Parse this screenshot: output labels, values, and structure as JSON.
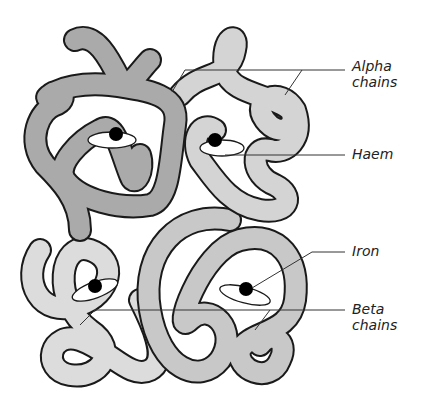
{
  "labels": {
    "alpha": "Alpha\nchains",
    "alpha_line1": "Alpha",
    "alpha_line2": "chains",
    "haem": "Haem",
    "iron": "Iron",
    "beta_line1": "Beta",
    "beta_line2": "chains"
  },
  "colors": {
    "alpha_dark": "#a8a8a8",
    "alpha_light": "#cfcfcf",
    "beta_light": "#dcdcdc",
    "beta_mid": "#c4c4c4",
    "outline": "#1a1a1a",
    "iron": "#000000",
    "haem_disc": "#ffffff"
  },
  "components": [
    {
      "name": "Alpha chain (left)",
      "shade": "dark"
    },
    {
      "name": "Alpha chain (right)",
      "shade": "light"
    },
    {
      "name": "Beta chain (left)",
      "shade": "light"
    },
    {
      "name": "Beta chain (right)",
      "shade": "mid"
    }
  ]
}
